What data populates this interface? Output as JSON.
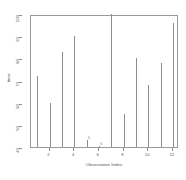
{
  "chart_data": {
    "type": "bar",
    "title": "",
    "subtitle": "",
    "xlabel": "Observation Index",
    "ylabel": "time",
    "x": [
      1,
      2,
      3,
      4,
      5,
      6,
      7,
      8,
      9,
      10,
      11,
      12
    ],
    "categories": [
      "1",
      "2",
      "3",
      "4",
      "5",
      "6",
      "7",
      "8",
      "9",
      "10",
      "11",
      "12"
    ],
    "values": [
      72,
      60,
      83,
      90,
      43,
      40.5,
      100,
      55,
      80,
      68,
      78,
      96
    ],
    "series": [
      {
        "name": "time",
        "values": [
          72,
          60,
          83,
          90,
          43,
          40.5,
          100,
          55,
          80,
          68,
          78,
          96
        ]
      }
    ],
    "point_labels": [
      {
        "x": 5,
        "y": 43,
        "text": "5"
      },
      {
        "x": 6,
        "y": 40.5,
        "text": "6"
      }
    ],
    "xlim": [
      0.5,
      12.5
    ],
    "ylim": [
      40,
      100
    ],
    "xticks": [
      2,
      4,
      6,
      8,
      10,
      12
    ],
    "xticklabels": [
      "2",
      "4",
      "6",
      "8",
      "10",
      "12"
    ],
    "yticks": [
      40,
      50,
      60,
      70,
      80,
      90,
      100
    ],
    "yticklabels": [
      "40",
      "50",
      "60",
      "70",
      "80",
      "90",
      "100"
    ],
    "grid": false,
    "legend": false,
    "legend_position": "none",
    "line_color": "#8d8d8d",
    "axis_color": "#8d8d8d",
    "background_color": "#ffffff",
    "plot_style": "h"
  }
}
